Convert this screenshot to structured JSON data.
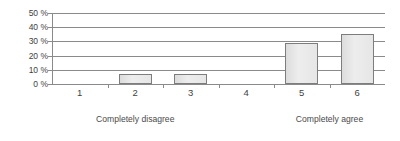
{
  "chart_data": {
    "type": "bar",
    "title": "",
    "subtitle": "",
    "xlabel": "",
    "ylabel": "",
    "categories": [
      "1",
      "2",
      "3",
      "4",
      "5",
      "6"
    ],
    "values": [
      0,
      7,
      7,
      0,
      29,
      35
    ],
    "ylim": [
      0,
      50
    ],
    "ytick_values": [
      0,
      10,
      20,
      30,
      40,
      50
    ],
    "ytick_labels": [
      "0 %",
      "10 %",
      "20 %",
      "30 %",
      "40 %",
      "50 %"
    ],
    "grid": "horizontal",
    "legend": null,
    "series": [
      {
        "name": "",
        "values": [
          0,
          7,
          7,
          0,
          29,
          35
        ]
      }
    ],
    "annotations": {
      "scale_anchor_low": "Completely disagree",
      "scale_anchor_high": "Completely agree"
    },
    "colors": {
      "bar_fill": "#e8e8e8",
      "bar_border": "#7d7d7d",
      "gridline": "#8a8a8a",
      "axis": "#8a8a8a",
      "text": "#3f3f3f",
      "background": "#ffffff"
    }
  }
}
